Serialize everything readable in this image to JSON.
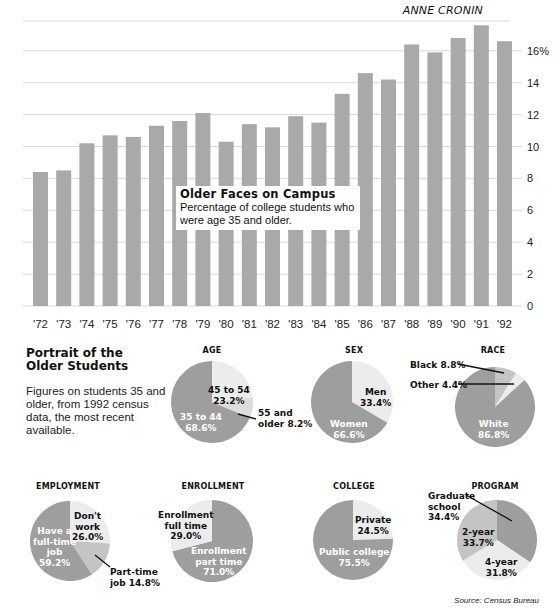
{
  "header": {
    "byline": "ANNE CRONIN"
  },
  "caption": {
    "title": "Older Faces on Campus",
    "subtitle": "Percentage of college students who were age 35 and older."
  },
  "portrait": {
    "title_line1": "Portrait of the",
    "title_line2": "Older Students",
    "description": "Figures on students 35 and older, from 1992 census data, the most recent available."
  },
  "source": "Source: Census Bureau",
  "colors": {
    "bar": "#a9a9a9",
    "grid": "#d9d9d9",
    "pie_dark": "#9e9e9e",
    "pie_medium": "#c4c4c4",
    "pie_light": "#ececec"
  },
  "chart_data": [
    {
      "type": "bar",
      "title": "Older Faces on Campus",
      "subtitle": "Percentage of college students who were age 35 and older.",
      "categories": [
        "'72",
        "'73",
        "'74",
        "'75",
        "'76",
        "'77",
        "'78",
        "'79",
        "'80",
        "'81",
        "'82",
        "'83",
        "'84",
        "'85",
        "'86",
        "'87",
        "'88",
        "'89",
        "'90",
        "'91",
        "'92"
      ],
      "values": [
        8.4,
        8.5,
        10.2,
        10.7,
        10.6,
        11.3,
        11.6,
        12.1,
        10.3,
        11.4,
        11.2,
        11.9,
        11.5,
        13.3,
        14.6,
        14.2,
        16.4,
        15.9,
        16.8,
        17.6,
        16.6
      ],
      "xlabel": "",
      "ylabel": "",
      "yticks": [
        "0",
        "2",
        "4",
        "6",
        "8",
        "10",
        "12",
        "14",
        "16%"
      ],
      "ylim": [
        0,
        18
      ],
      "grid": true,
      "y_axis_position": "right"
    },
    {
      "type": "pie",
      "title": "AGE",
      "slices": [
        {
          "label": "45 to 54",
          "value": 23.2
        },
        {
          "label": "55 and older",
          "value": 8.2
        },
        {
          "label": "35 to 44",
          "value": 68.6
        }
      ]
    },
    {
      "type": "pie",
      "title": "SEX",
      "slices": [
        {
          "label": "Men",
          "value": 33.4
        },
        {
          "label": "Women",
          "value": 66.6
        }
      ]
    },
    {
      "type": "pie",
      "title": "RACE",
      "slices": [
        {
          "label": "Black",
          "value": 8.8
        },
        {
          "label": "Other",
          "value": 4.4
        },
        {
          "label": "White",
          "value": 86.8
        }
      ]
    },
    {
      "type": "pie",
      "title": "EMPLOYMENT",
      "slices": [
        {
          "label": "Don't work",
          "value": 26.0
        },
        {
          "label": "Part-time job",
          "value": 14.8
        },
        {
          "label": "Have a full-time job",
          "value": 59.2
        }
      ]
    },
    {
      "type": "pie",
      "title": "ENROLLMENT",
      "slices": [
        {
          "label": "Enrollment part time",
          "value": 71.0
        },
        {
          "label": "Enrollment full time",
          "value": 29.0
        }
      ]
    },
    {
      "type": "pie",
      "title": "COLLEGE",
      "slices": [
        {
          "label": "Private",
          "value": 24.5
        },
        {
          "label": "Public college",
          "value": 75.5
        }
      ]
    },
    {
      "type": "pie",
      "title": "PROGRAM",
      "slices": [
        {
          "label": "Graduate school",
          "value": 34.4
        },
        {
          "label": "4-year",
          "value": 31.8
        },
        {
          "label": "2-year",
          "value": 33.7
        }
      ]
    }
  ],
  "pies": {
    "age": {
      "title": "AGE",
      "l1a": "45 to 54",
      "l1b": "23.2%",
      "l2a": "55 and",
      "l2b": "older 8.2%",
      "l3a": "35 to 44",
      "l3b": "68.6%"
    },
    "sex": {
      "title": "SEX",
      "l1a": "Men",
      "l1b": "33.4%",
      "l2a": "Women",
      "l2b": "66.6%"
    },
    "race": {
      "title": "RACE",
      "l1": "Black 8.8%",
      "l2": "Other 4.4%",
      "l3a": "White",
      "l3b": "86.8%"
    },
    "employment": {
      "title": "EMPLOYMENT",
      "l1a": "Don't",
      "l1b": "work",
      "l1c": "26.0%",
      "l2a": "Part-time",
      "l2b": "job 14.8%",
      "l3a": "Have a",
      "l3b": "full-time",
      "l3c": "job",
      "l3d": "59.2%"
    },
    "enrollment": {
      "title": "ENROLLMENT",
      "l1a": "Enrollment",
      "l1b": "full time",
      "l1c": "29.0%",
      "l2a": "Enrollment",
      "l2b": "part time",
      "l2c": "71.0%"
    },
    "college": {
      "title": "COLLEGE",
      "l1a": "Private",
      "l1b": "24.5%",
      "l2a": "Public college",
      "l2b": "75.5%"
    },
    "program": {
      "title": "PROGRAM",
      "l1a": "Graduate",
      "l1b": "school",
      "l1c": "34.4%",
      "l2a": "2-year",
      "l2b": "33.7%",
      "l3a": "4-year",
      "l3b": "31.8%"
    }
  }
}
